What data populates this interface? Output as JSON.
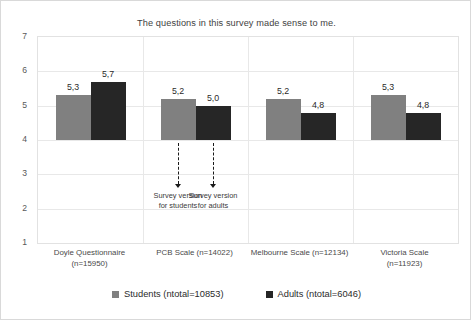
{
  "chart_data": {
    "type": "bar",
    "title": "The questions in this survey made sense to me.",
    "xlabel": "",
    "ylabel": "",
    "ylim": [
      1,
      7
    ],
    "yticks": [
      1,
      2,
      3,
      4,
      5,
      6,
      7
    ],
    "ytick_labels": [
      "1",
      "2",
      "3",
      "4",
      "5",
      "6",
      "7"
    ],
    "bar_baseline": 4,
    "grid": true,
    "grid_axis": "both",
    "legend_position": "bottom",
    "decimal_separator": ",",
    "categories": [
      "Doyle Questionnaire (n=15950)",
      "PCB Scale (n=14022)",
      "Melbourne Scale (n=12134)",
      "Victoria Scale (n=11923)"
    ],
    "series": [
      {
        "name": "Students (ntotal=10853)",
        "color": "#808080",
        "values": [
          5.3,
          5.2,
          5.2,
          5.3
        ],
        "value_labels": [
          "5,3",
          "5,2",
          "5,2",
          "5,3"
        ]
      },
      {
        "name": "Adults (ntotal=6046)",
        "color": "#262626",
        "values": [
          5.7,
          5.0,
          4.8,
          4.8
        ],
        "value_labels": [
          "5,7",
          "5,0",
          "4,8",
          "4,8"
        ]
      }
    ],
    "annotations": [
      {
        "text_line1": "Survey version",
        "text_line2": "for students",
        "points_to_group": "PCB Scale (n=14022)",
        "points_to_series": "Students (ntotal=10853)"
      },
      {
        "text_line1": "Survey version",
        "text_line2": "for adults",
        "points_to_group": "PCB Scale (n=14022)",
        "points_to_series": "Adults (ntotal=6046)"
      }
    ]
  },
  "categories_display": [
    {
      "line1": "Doyle Questionnaire",
      "line2": "(n=15950)"
    },
    {
      "line1": "PCB Scale (n=14022)",
      "line2": ""
    },
    {
      "line1": "Melbourne Scale (n=12134)",
      "line2": ""
    },
    {
      "line1": "Victoria Scale (n=11923)",
      "line2": ""
    }
  ]
}
